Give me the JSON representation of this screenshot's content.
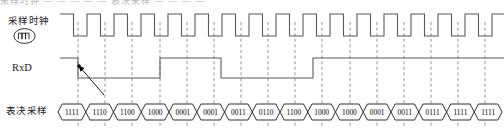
{
  "figure": {
    "top_cutoff_text": "采样时钟  — — — — —  表决采样  — — — —"
  },
  "rows": [
    {
      "id": "sample-clock",
      "label": "采样时钟",
      "icon": "pulse-clock-icon"
    },
    {
      "id": "rxd",
      "label": "RxD",
      "icon": ""
    },
    {
      "id": "voting-sample",
      "label": "表决采样",
      "icon": ""
    }
  ],
  "colors": {
    "waveform": "#595959",
    "bus_outline": "#1a1a1a",
    "gridline": "#7a7a7a",
    "arrow": "#000000",
    "text": "#1a1a1a",
    "background": "#ffffff"
  },
  "chart_data": {
    "type": "line",
    "title": "",
    "xlabel": "",
    "ylabel": "",
    "grid": true,
    "legend_position": "left",
    "x_start_px": 60,
    "clock_period_px": 27,
    "clock_cycles": 16,
    "series": [
      {
        "name": "采样时钟",
        "type": "clock",
        "initial_level": 1,
        "description": "square wave, 16 cycles, 50% duty, starts high"
      },
      {
        "name": "RxD",
        "type": "digital",
        "transitions": [
          {
            "x": 60,
            "level": 1
          },
          {
            "x": 78,
            "level": 0
          },
          {
            "x": 160,
            "level": 1
          },
          {
            "x": 221,
            "level": 0
          },
          {
            "x": 313,
            "level": 1
          },
          {
            "x": 504,
            "level": 1
          }
        ]
      }
    ],
    "bus_cells": [
      "1111",
      "1110",
      "1100",
      "1000",
      "0001",
      "0001",
      "0011",
      "0110",
      "1100",
      "1000",
      "1000",
      "0001",
      "0011",
      "0111",
      "1111",
      "1111"
    ],
    "gridline_x": [
      78,
      105,
      132,
      160,
      187,
      214,
      241,
      268,
      295,
      322,
      350,
      377,
      404,
      431,
      458,
      485
    ],
    "annotations": [
      {
        "type": "arrow",
        "name": "falling-edge-callout",
        "from_x": 104,
        "from_y": 95,
        "to_x": 79,
        "to_y": 66,
        "description": "arrow from first changed voting-sample cell to RxD falling edge"
      }
    ]
  }
}
